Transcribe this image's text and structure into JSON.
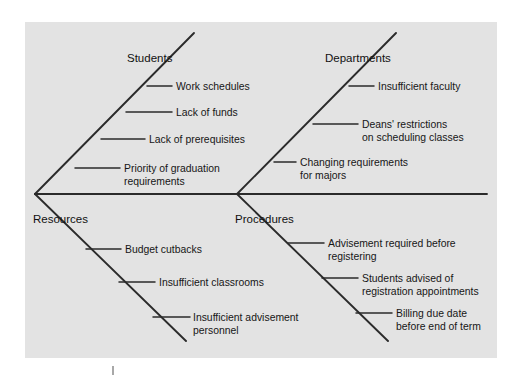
{
  "diagram": {
    "type": "fishbone-cause-and-effect",
    "background_color": "#e3e3e3",
    "line_color": "#2b2b2b",
    "page_color": "#ffffff",
    "branches": [
      {
        "id": "students",
        "label": "Students",
        "position": "upper-left",
        "causes": [
          {
            "text": "Work schedules"
          },
          {
            "text": "Lack of funds"
          },
          {
            "text": "Lack of prerequisites"
          },
          {
            "text": "Priority of graduation",
            "text2": "requirements"
          }
        ]
      },
      {
        "id": "departments",
        "label": "Departments",
        "position": "upper-right",
        "causes": [
          {
            "text": "Insufficient faculty"
          },
          {
            "text": "Deans' restrictions",
            "text2": "on scheduling classes"
          },
          {
            "text": "Changing requirements",
            "text2": "for majors"
          }
        ]
      },
      {
        "id": "resources",
        "label": "Resources",
        "position": "lower-left",
        "causes": [
          {
            "text": "Budget cutbacks"
          },
          {
            "text": "Insufficient classrooms"
          },
          {
            "text": "Insufficient advisement",
            "text2": "personnel"
          }
        ]
      },
      {
        "id": "procedures",
        "label": "Procedures",
        "position": "lower-right",
        "causes": [
          {
            "text": "Advisement required before",
            "text2": "registering"
          },
          {
            "text": "Students advised of",
            "text2": "registration appointments"
          },
          {
            "text": "Billing due date",
            "text2": "before end of term"
          }
        ]
      }
    ]
  }
}
